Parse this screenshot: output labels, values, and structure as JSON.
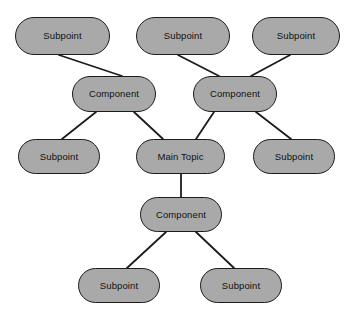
{
  "diagram": {
    "background_color": "#ffffff",
    "node_fill_color": "#a9a9a9",
    "node_border_color": "#1c1c1c",
    "edge_color": "#1c1c1c",
    "text_color": "#111111",
    "nodes": [
      {
        "id": "subpoint-top-left",
        "label": "Subpoint",
        "x": 15,
        "y": 17,
        "w": 95,
        "h": 38
      },
      {
        "id": "subpoint-top-middle",
        "label": "Subpoint",
        "x": 136,
        "y": 17,
        "w": 94,
        "h": 38
      },
      {
        "id": "subpoint-top-right",
        "label": "Subpoint",
        "x": 252,
        "y": 17,
        "w": 88,
        "h": 38
      },
      {
        "id": "component-left",
        "label": "Component",
        "x": 72,
        "y": 76,
        "w": 84,
        "h": 36
      },
      {
        "id": "component-right",
        "label": "Component",
        "x": 193,
        "y": 76,
        "w": 84,
        "h": 36
      },
      {
        "id": "subpoint-middle-left",
        "label": "Subpoint",
        "x": 18,
        "y": 139,
        "w": 82,
        "h": 35
      },
      {
        "id": "main-topic",
        "label": "Main Topic",
        "x": 136,
        "y": 139,
        "w": 89,
        "h": 35
      },
      {
        "id": "subpoint-middle-right",
        "label": "Subpoint",
        "x": 253,
        "y": 139,
        "w": 82,
        "h": 35
      },
      {
        "id": "component-bottom",
        "label": "Component",
        "x": 140,
        "y": 197,
        "w": 82,
        "h": 35
      },
      {
        "id": "subpoint-bottom-left",
        "label": "Subpoint",
        "x": 78,
        "y": 268,
        "w": 82,
        "h": 35
      },
      {
        "id": "subpoint-bottom-right",
        "label": "Subpoint",
        "x": 200,
        "y": 268,
        "w": 82,
        "h": 35
      }
    ],
    "edges": [
      {
        "id": "edge-stl-cl",
        "from": "subpoint-top-left",
        "to": "component-left",
        "x1": 59,
        "y1": 55,
        "x2": 122,
        "y2": 76
      },
      {
        "id": "edge-stm-cr",
        "from": "subpoint-top-middle",
        "to": "component-right",
        "x1": 178,
        "y1": 55,
        "x2": 219,
        "y2": 76
      },
      {
        "id": "edge-str-cr",
        "from": "subpoint-top-right",
        "to": "component-right",
        "x1": 290,
        "y1": 55,
        "x2": 251,
        "y2": 76
      },
      {
        "id": "edge-cl-sml",
        "from": "component-left",
        "to": "subpoint-middle-left",
        "x1": 96,
        "y1": 112,
        "x2": 62,
        "y2": 139
      },
      {
        "id": "edge-cl-mt",
        "from": "component-left",
        "to": "main-topic",
        "x1": 134,
        "y1": 112,
        "x2": 163,
        "y2": 139
      },
      {
        "id": "edge-cr-mt",
        "from": "component-right",
        "to": "main-topic",
        "x1": 214,
        "y1": 112,
        "x2": 196,
        "y2": 139
      },
      {
        "id": "edge-cr-smr",
        "from": "component-right",
        "to": "subpoint-middle-right",
        "x1": 256,
        "y1": 112,
        "x2": 291,
        "y2": 139
      },
      {
        "id": "edge-mt-cb",
        "from": "main-topic",
        "to": "component-bottom",
        "x1": 181,
        "y1": 174,
        "x2": 181,
        "y2": 197
      },
      {
        "id": "edge-cb-sbl",
        "from": "component-bottom",
        "to": "subpoint-bottom-left",
        "x1": 166,
        "y1": 232,
        "x2": 127,
        "y2": 268
      },
      {
        "id": "edge-cb-sbr",
        "from": "component-bottom",
        "to": "subpoint-bottom-right",
        "x1": 196,
        "y1": 232,
        "x2": 234,
        "y2": 268
      }
    ]
  }
}
